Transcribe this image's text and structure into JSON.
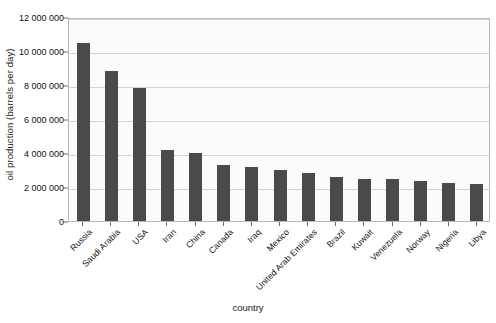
{
  "chart_data": {
    "type": "bar",
    "title": "",
    "xlabel": "country",
    "ylabel": "oil production (barrels per day)",
    "ylim": [
      0,
      12000000
    ],
    "ytick_step": 2000000,
    "ytick_labels": [
      "12 000 000",
      "10 000 000",
      "8 000 000",
      "6 000 000",
      "4 000 000",
      "2 000 000",
      "0"
    ],
    "ytick_values": [
      12000000,
      10000000,
      8000000,
      6000000,
      4000000,
      2000000,
      0
    ],
    "grid": true,
    "legend": false,
    "bar_color": "#4a4a4a",
    "plot_background": "#fbfbfb",
    "gridline_color": "#d4d4d4",
    "frame_color": "#b8b8b8",
    "categories": [
      "Russia",
      "Saudi Arabia",
      "USA",
      "Iran",
      "China",
      "Canada",
      "Iraq",
      "Mexico",
      "United Arab Emirates",
      "Brazil",
      "Kuwait",
      "Venezuela",
      "Norway",
      "Nigeria",
      "Libya"
    ],
    "values": [
      10500000,
      8800000,
      7800000,
      4200000,
      4000000,
      3300000,
      3150000,
      3000000,
      2800000,
      2600000,
      2500000,
      2500000,
      2350000,
      2250000,
      2200000
    ]
  }
}
